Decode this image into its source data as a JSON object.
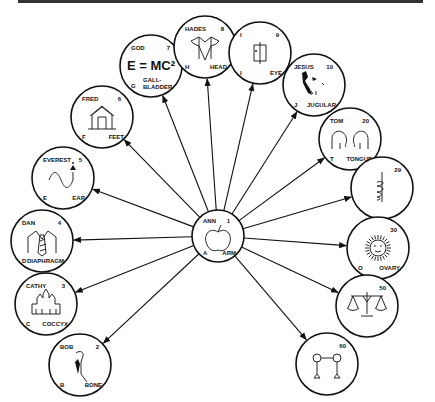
{
  "hub": {
    "name": "ANN",
    "number": "1",
    "initial": "A",
    "body_part": "ARM",
    "image": "apple-icon"
  },
  "nodes": [
    {
      "name": "BOB",
      "number": "2",
      "initial": "B",
      "body_part": "BONE",
      "image": "bone-figure-icon"
    },
    {
      "name": "CATHY",
      "number": "3",
      "initial": "C",
      "body_part": "COCCYX",
      "image": "castle-icon"
    },
    {
      "name": "DAN",
      "number": "4",
      "initial": "D",
      "body_part": "DIAPHRAGM",
      "image": "shirt-tie-icon"
    },
    {
      "name": "EVEREST",
      "number": "5",
      "initial": "E",
      "body_part": "EAR",
      "image": "wave-arrow-icon"
    },
    {
      "name": "FRED",
      "number": "6",
      "initial": "F",
      "body_part": "FEET",
      "image": "house-icon"
    },
    {
      "name": "GOD",
      "number": "7",
      "initial": "G",
      "body_part": "GALL-BLADDER",
      "image": "formula-text",
      "formula": "E = MC²"
    },
    {
      "name": "HADES",
      "number": "8",
      "initial": "H",
      "body_part": "HEAD",
      "image": "tuxedo-icon"
    },
    {
      "name": "I",
      "number": "9",
      "initial": "I",
      "body_part": "EYE",
      "image": "door-icon"
    },
    {
      "name": "JESUS",
      "number": "10",
      "initial": "J",
      "body_part": "JUGULAR",
      "image": "profile-figure-icon"
    },
    {
      "name": "TOM",
      "number": "20",
      "initial": "T",
      "body_part": "TONGUE",
      "image": "elephants-icon"
    },
    {
      "name": "",
      "number": "29",
      "initial": "",
      "body_part": "",
      "image": "caduceus-icon"
    },
    {
      "name": "",
      "number": "30",
      "initial": "O",
      "body_part": "OVARY",
      "image": "sun-icon"
    },
    {
      "name": "",
      "number": "50",
      "initial": "",
      "body_part": "",
      "image": "scales-icon"
    },
    {
      "name": "",
      "number": "60",
      "initial": "",
      "body_part": "",
      "image": "dumbbell-figures-icon"
    }
  ]
}
